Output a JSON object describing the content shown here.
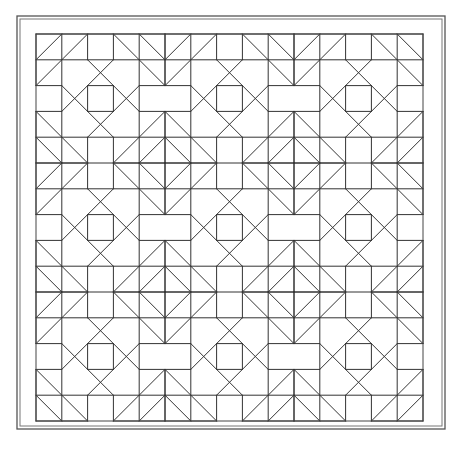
{
  "image": {
    "title": "Quilt block line-art pattern",
    "description": "Black line drawing of a 15x15 quilt grid composed of a 3x3 repeat of 5x5 octagon blocks, with diamond motifs where blocks meet, inside a double-line frame"
  },
  "colors": {
    "background": "#ffffff",
    "line": "#333333",
    "frame": "#555555"
  },
  "frame": {
    "outer": {
      "x": 17,
      "y": 16,
      "w": 428,
      "h": 413
    },
    "inner": {
      "x": 20,
      "y": 19,
      "w": 422,
      "h": 407
    }
  },
  "grid": {
    "x": 36,
    "y": 34,
    "cols": 15,
    "rows": 15,
    "cell": 25.8,
    "block_size": 5,
    "blocks_across": 3,
    "blocks_down": 3
  },
  "block_pattern": {
    "horizontal_segments": [
      [
        0,
        0,
        5
      ],
      [
        1,
        0,
        5
      ],
      [
        2,
        0,
        1
      ],
      [
        2,
        2,
        3
      ],
      [
        2,
        4,
        5
      ],
      [
        3,
        0,
        1
      ],
      [
        3,
        2,
        3
      ],
      [
        3,
        4,
        5
      ],
      [
        4,
        0,
        5
      ],
      [
        5,
        0,
        2
      ],
      [
        5,
        3,
        5
      ]
    ],
    "vertical_segments": [
      [
        0,
        0,
        2
      ],
      [
        0,
        3,
        5
      ],
      [
        1,
        0,
        5
      ],
      [
        2,
        0,
        1
      ],
      [
        2,
        2,
        3
      ],
      [
        2,
        4,
        5
      ],
      [
        3,
        0,
        1
      ],
      [
        3,
        2,
        3
      ],
      [
        3,
        4,
        5
      ],
      [
        4,
        0,
        5
      ],
      [
        5,
        0,
        2
      ],
      [
        5,
        3,
        5
      ]
    ],
    "diagonal_segments": [
      [
        0,
        1,
        1,
        0
      ],
      [
        0,
        2,
        2,
        0
      ],
      [
        4,
        0,
        5,
        1
      ],
      [
        3,
        0,
        5,
        2
      ],
      [
        0,
        4,
        1,
        5
      ],
      [
        0,
        3,
        2,
        5
      ],
      [
        4,
        5,
        5,
        4
      ],
      [
        3,
        5,
        5,
        3
      ],
      [
        2,
        1,
        4,
        3
      ],
      [
        1,
        2,
        3,
        4
      ],
      [
        3,
        1,
        1,
        3
      ],
      [
        4,
        2,
        2,
        4
      ]
    ]
  }
}
